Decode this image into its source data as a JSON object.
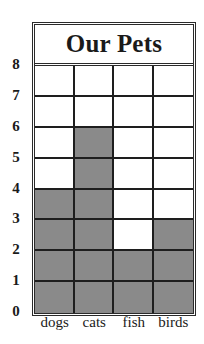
{
  "chart_data": {
    "type": "bar",
    "title": "Our Pets",
    "categories": [
      "dogs",
      "cats",
      "fish",
      "birds"
    ],
    "values": [
      4,
      6,
      2,
      3
    ],
    "xlabel": "",
    "ylabel": "",
    "ylim": [
      0,
      8
    ],
    "yticks": [
      "0",
      "1",
      "2",
      "3",
      "4",
      "5",
      "6",
      "7",
      "8"
    ],
    "grid": true,
    "legend": null,
    "colors": {
      "bar": "#8a8a8a",
      "grid": "#1e1e1e",
      "background": "#ffffff"
    }
  }
}
